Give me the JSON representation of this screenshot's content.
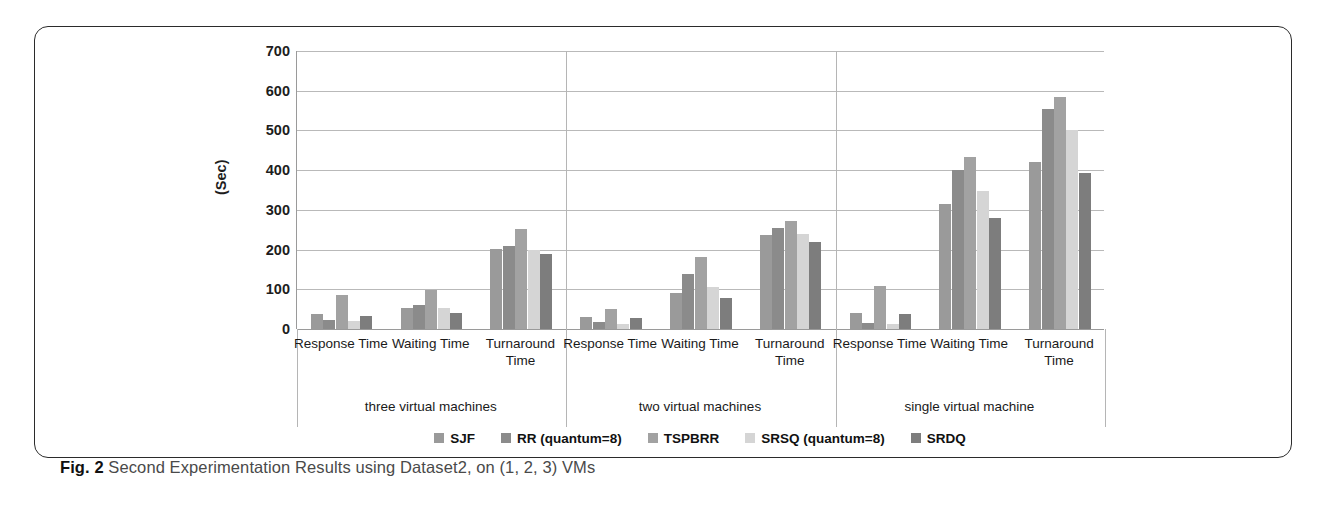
{
  "caption": {
    "prefix": "Fig. 2",
    "text": " Second Experimentation Results using Dataset2, on (1, 2, 3) VMs"
  },
  "chart_data": {
    "type": "bar",
    "title": "",
    "xlabel": "",
    "ylabel": "(Sec)",
    "ylim": [
      0,
      700
    ],
    "ytick_step": 100,
    "yticks": [
      0,
      100,
      200,
      300,
      400,
      500,
      600,
      700
    ],
    "grid": true,
    "legend_position": "bottom",
    "groups": [
      {
        "name": "three virtual machines",
        "categories": [
          "Response Time",
          "Waiting Time",
          "Turnaround Time"
        ]
      },
      {
        "name": "two virtual machines",
        "categories": [
          "Response Time",
          "Waiting Time",
          "Turnaround Time"
        ]
      },
      {
        "name": "single virtual machine",
        "categories": [
          "Response Time",
          "Waiting Time",
          "Turnaround Time"
        ]
      }
    ],
    "categories": [
      "three VM / Response Time",
      "three VM / Waiting Time",
      "three VM / Turnaround Time",
      "two VM / Response Time",
      "two VM / Waiting Time",
      "two VM / Turnaround Time",
      "single VM / Response Time",
      "single VM / Waiting Time",
      "single VM / Turnaround Time"
    ],
    "series": [
      {
        "name": "SJF",
        "color": "#9a9a9a",
        "values": [
          37,
          52,
          202,
          30,
          90,
          237,
          40,
          315,
          420
        ]
      },
      {
        "name": "RR (quantum=8)",
        "color": "#8b8b8b",
        "values": [
          22,
          60,
          210,
          18,
          138,
          255,
          15,
          400,
          553
        ]
      },
      {
        "name": "TSPBRR",
        "color": "#a2a2a2",
        "values": [
          85,
          98,
          252,
          50,
          182,
          272,
          108,
          433,
          583
        ]
      },
      {
        "name": "SRSQ (quantum=8)",
        "color": "#d5d5d5",
        "values": [
          20,
          52,
          200,
          12,
          105,
          240,
          13,
          348,
          500
        ]
      },
      {
        "name": "SRDQ",
        "color": "#7d7d7d",
        "values": [
          32,
          40,
          190,
          28,
          77,
          218,
          37,
          280,
          393
        ]
      }
    ]
  }
}
